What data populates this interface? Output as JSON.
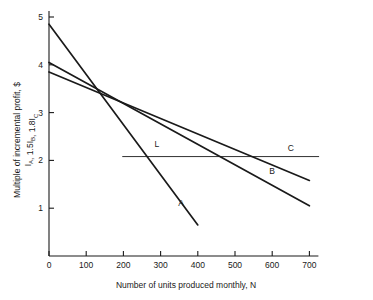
{
  "chart_data": {
    "type": "line",
    "title": "",
    "xlabel": "Number of units produced monthly, N",
    "ylabel_line1": "Multiple of incremental profit, $",
    "ylabel_line2_parts": [
      {
        "base": "I",
        "sub": "A"
      },
      {
        "base": ", 1.5I",
        "sub": "B"
      },
      {
        "base": ", 1.8I",
        "sub": "C"
      }
    ],
    "ylabel_line2_plain": "IA, 1.5IB, 1.8IC",
    "xlim": [
      0,
      700
    ],
    "ylim": [
      0,
      5
    ],
    "xticks": [
      0,
      100,
      200,
      300,
      400,
      500,
      600,
      700
    ],
    "xtick_labels": [
      "0",
      "100",
      "200",
      "300",
      "400",
      "500",
      "600",
      "700"
    ],
    "yticks": [
      1,
      2,
      3,
      4,
      5
    ],
    "ytick_labels": [
      "1",
      "2",
      "3",
      "4",
      "5"
    ],
    "grid": false,
    "legend": "inline-curve-labels",
    "series": [
      {
        "name": "A",
        "label": "A",
        "label_x": 355,
        "label_y": 1.05,
        "points": [
          [
            0,
            4.85
          ],
          [
            400,
            0.65
          ]
        ]
      },
      {
        "name": "B",
        "label": "B",
        "label_x": 600,
        "label_y": 1.72,
        "points": [
          [
            0,
            4.05
          ],
          [
            700,
            1.05
          ]
        ]
      },
      {
        "name": "C",
        "label": "C",
        "label_x": 650,
        "label_y": 2.2,
        "points": [
          [
            0,
            3.85
          ],
          [
            700,
            1.58
          ]
        ]
      },
      {
        "name": "L",
        "label": "L",
        "label_x": 290,
        "label_y": 2.27,
        "points": [
          [
            198,
            2.08
          ],
          [
            725,
            2.08
          ]
        ]
      }
    ],
    "colors": {
      "axis": "#1a1a1a",
      "curve": "#1a1a1a",
      "background": "#ffffff"
    }
  }
}
